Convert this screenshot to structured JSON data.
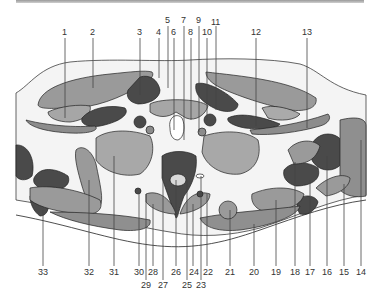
{
  "figure": {
    "type": "anatomical cross-section (axial)",
    "colors": {
      "background": "#ffffff",
      "skin_fill": "#f2f2f2",
      "light_gray": "#b9b9b9",
      "mid_gray": "#8f8f8f",
      "dark_gray": "#4a4a4a",
      "bone_light": "#a8a8a8",
      "outline": "#222222"
    },
    "labels_top": [
      "1",
      "2",
      "3",
      "4",
      "5",
      "6",
      "7",
      "8",
      "9",
      "10",
      "11",
      "12",
      "13"
    ],
    "labels_bottom_row1": [
      "33",
      "32",
      "31",
      "30",
      "28",
      "26",
      "24",
      "22",
      "21",
      "20",
      "19",
      "18",
      "17",
      "16",
      "15",
      "14"
    ],
    "labels_bottom_row2": [
      "29",
      "27",
      "25",
      "23"
    ]
  }
}
